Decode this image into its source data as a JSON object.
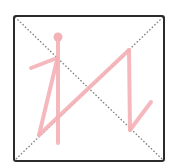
{
  "canvas": {
    "width": 172,
    "height": 165,
    "background": "#ffffff"
  },
  "grid_box": {
    "x": 14,
    "y": 16,
    "width": 150,
    "height": 145,
    "corner_radius": 2,
    "border_color": "#2b2b2b",
    "border_width": 2
  },
  "guide_lines": {
    "style": "dotted",
    "color": "#7a7a7a",
    "lines": [
      {
        "name": "diagonal-top-left-to-bottom-right",
        "x1": 15,
        "y1": 17,
        "x2": 163,
        "y2": 160
      },
      {
        "name": "diagonal-top-right-to-bottom-left",
        "x1": 163,
        "y1": 17,
        "x2": 15,
        "y2": 160
      }
    ]
  },
  "strokes": {
    "color": "#f4b1b6",
    "width": 4,
    "head_dot": {
      "cx": 58,
      "cy": 37,
      "r": 4.5
    },
    "paths": [
      {
        "name": "vertical-stem",
        "points": [
          [
            58,
            38
          ],
          [
            58,
            143
          ]
        ]
      },
      {
        "name": "left-arm",
        "points": [
          [
            57,
            58
          ],
          [
            31,
            68
          ]
        ]
      },
      {
        "name": "left-leg",
        "points": [
          [
            57,
            60
          ],
          [
            39,
            135
          ]
        ]
      },
      {
        "name": "long-diagonal",
        "points": [
          [
            39,
            135
          ],
          [
            129,
            50
          ]
        ]
      },
      {
        "name": "right-vertical",
        "points": [
          [
            129,
            50
          ],
          [
            130,
            130
          ]
        ]
      },
      {
        "name": "right-hook",
        "points": [
          [
            130,
            130
          ],
          [
            151,
            102
          ]
        ]
      }
    ]
  }
}
